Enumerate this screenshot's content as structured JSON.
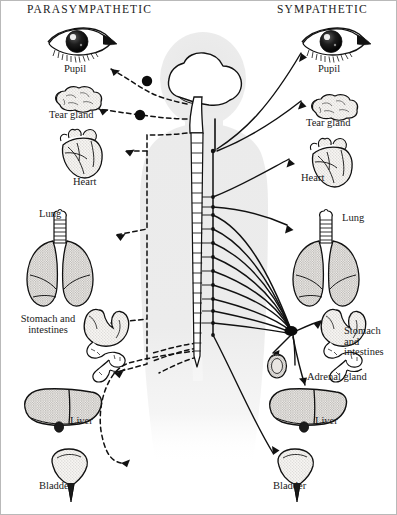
{
  "figure": {
    "headings": {
      "left": "PARASYMPATHETIC",
      "right": "SYMPATHETIC"
    },
    "parasympathetic_organs": [
      {
        "key": "pupil",
        "label": "Pupil"
      },
      {
        "key": "tear",
        "label": "Tear gland"
      },
      {
        "key": "heart",
        "label": "Heart"
      },
      {
        "key": "lung",
        "label": "Lung"
      },
      {
        "key": "stomach",
        "label": "Stomach\nand\nintestines"
      },
      {
        "key": "liver",
        "label": "Liver"
      },
      {
        "key": "bladder",
        "label": "Bladder"
      }
    ],
    "sympathetic_organs": [
      {
        "key": "pupil",
        "label": "Pupil"
      },
      {
        "key": "tear",
        "label": "Tear gland"
      },
      {
        "key": "heart",
        "label": "Heart"
      },
      {
        "key": "lung",
        "label": "Lung"
      },
      {
        "key": "stomach",
        "label": "Stomach\nand\nintestines"
      },
      {
        "key": "adrenal",
        "label": "Adrenal gland"
      },
      {
        "key": "liver",
        "label": "Liver"
      },
      {
        "key": "bladder",
        "label": "Bladder"
      }
    ],
    "colors": {
      "ink": "#111111",
      "silhouette": "#ececec",
      "organ_fill": "#f4f2ef",
      "stipple": "#6f6f6f",
      "background": "#ffffff"
    }
  }
}
